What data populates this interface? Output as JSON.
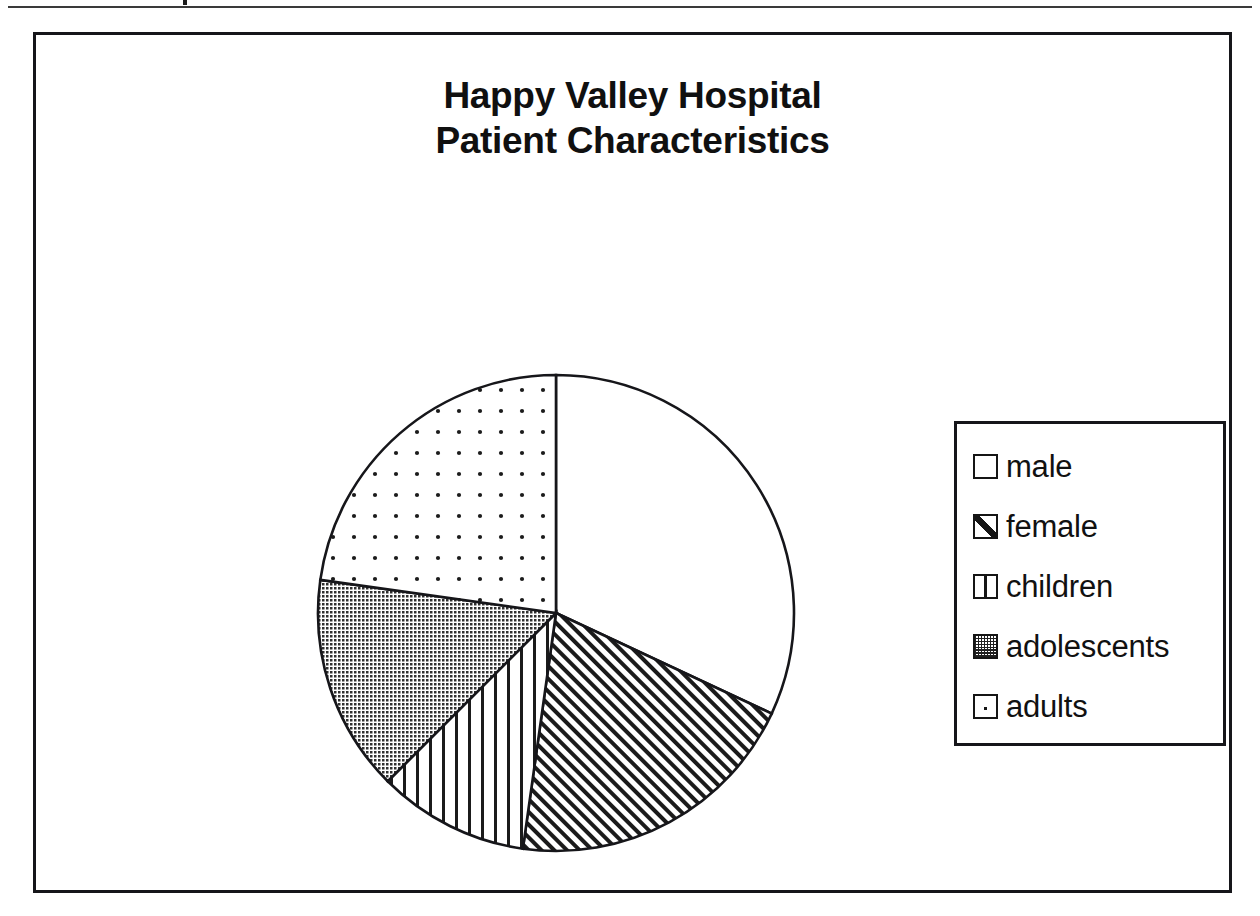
{
  "document": {
    "top_rule": "horizontal-rule",
    "frame": "chart-border"
  },
  "chart": {
    "title_line1": "Happy Valley Hospital",
    "title_line2": "Patient Characteristics"
  },
  "legend": {
    "items": [
      {
        "label": "male",
        "pattern": "solid-white",
        "swatch": "legend-swatch-male"
      },
      {
        "label": "female",
        "pattern": "diagonal-hatch",
        "swatch": "legend-swatch-female"
      },
      {
        "label": "children",
        "pattern": "vertical-lines",
        "swatch": "legend-swatch-children"
      },
      {
        "label": "adolescents",
        "pattern": "dense-grid",
        "swatch": "legend-swatch-adolescents"
      },
      {
        "label": "adults",
        "pattern": "sparse-dots",
        "swatch": "legend-swatch-adults"
      }
    ]
  },
  "chart_data": {
    "type": "pie",
    "title": "Happy Valley Hospital Patient Characteristics",
    "xlabel": "",
    "ylabel": "",
    "legend_position": "right",
    "grid": false,
    "start_angle_deg": 0,
    "direction": "clockwise",
    "categories": [
      "male",
      "female",
      "children",
      "adolescents",
      "adults"
    ],
    "values": [
      32,
      20,
      10,
      15,
      23
    ],
    "units": "percent",
    "slices": [
      {
        "label": "male",
        "percent": 32,
        "angle_deg": 115,
        "start_deg": 0,
        "end_deg": 115,
        "pattern": "solid-white"
      },
      {
        "label": "female",
        "percent": 20,
        "angle_deg": 73,
        "start_deg": 115,
        "end_deg": 188,
        "pattern": "diagonal-hatch"
      },
      {
        "label": "children",
        "percent": 10,
        "angle_deg": 37,
        "start_deg": 188,
        "end_deg": 225,
        "pattern": "vertical-lines"
      },
      {
        "label": "adolescents",
        "percent": 15,
        "angle_deg": 53,
        "start_deg": 225,
        "end_deg": 278,
        "pattern": "dense-grid"
      },
      {
        "label": "adults",
        "percent": 23,
        "angle_deg": 82,
        "start_deg": 278,
        "end_deg": 360,
        "pattern": "sparse-dots"
      }
    ]
  },
  "colors": {
    "ink": "#16161a",
    "paper": "#ffffff",
    "adolescents_fill": "#8a8a8a"
  }
}
